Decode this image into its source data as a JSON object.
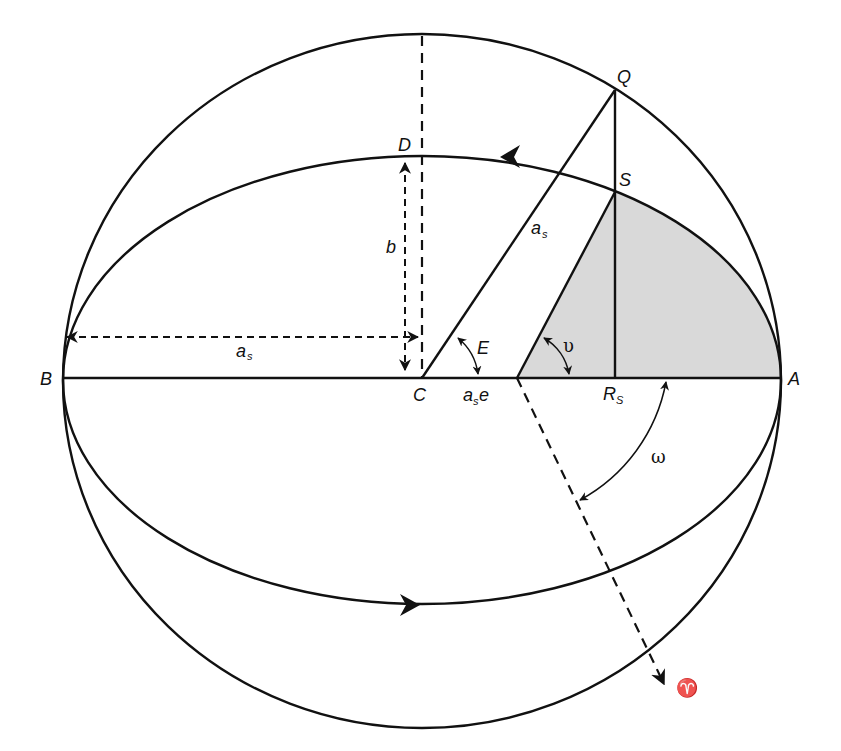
{
  "diagram": {
    "colors": {
      "line": "#111111",
      "shaded_area": "#d9d9d9",
      "background": "#ffffff"
    },
    "points": {
      "A": "A",
      "B": "B",
      "C": "C",
      "D": "D",
      "Q": "Q",
      "S": "S",
      "R": "R",
      "R_sub": "S"
    },
    "labels": {
      "semi_major_left": "a",
      "semi_major_left_sub": "s",
      "semi_major_cq": "a",
      "semi_major_cq_sub": "s",
      "semi_minor": "b",
      "focal_distance": "a",
      "focal_distance_sub": "s",
      "focal_distance_suffix": "e",
      "eccentric_anomaly": "E",
      "true_anomaly": "υ",
      "argument_of_perigee": "ω",
      "vernal_equinox": "♈"
    },
    "elements": {
      "outer_circle": "auxiliary circle of radius a_s",
      "ellipse": "orbit ellipse with semi-major a_s and semi-minor b",
      "shaded_region": "area swept from perigee A to satellite S about focus",
      "direction_arrows": [
        "counter-clockwise arrow on top of ellipse",
        "arrow on bottom of ellipse pointing right"
      ]
    }
  }
}
